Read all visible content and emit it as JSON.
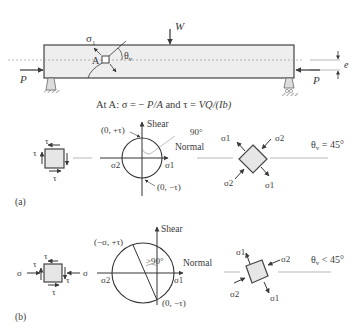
{
  "beam": {
    "load_label": "W",
    "left_force_label": "P",
    "right_force_label": "P",
    "eccentricity_label": "e",
    "point_label": "A",
    "sigma1_label": "σ1",
    "sigma1_main": "σ",
    "sigma1_sub": "1",
    "theta_label": "θ",
    "theta_sub": "v",
    "caption_prefix": "At A: σ = − ",
    "caption_sigma_expr": "P/A",
    "caption_and": " and ",
    "caption_tau_prefix": "τ = ",
    "caption_tau_expr": "VQ/(Ib)"
  },
  "panel_a": {
    "tag": "(a)",
    "element_tau": "τ",
    "mohr": {
      "shear_axis": "Shear",
      "normal_axis": "Normal",
      "top_point": "(0, +τ)",
      "bottom_point": "(0, −τ)",
      "angle": "90°",
      "sigma2": "σ2",
      "sigma1": "σ1"
    },
    "rotated_element": {
      "s1": "σ1",
      "s2": "σ2"
    },
    "theta_relation": "θv = 45°",
    "theta_main": "θ",
    "theta_sub": "v",
    "theta_rest": " = 45°"
  },
  "panel_b": {
    "tag": "(b)",
    "element_tau": "τ",
    "element_sigma": "σ",
    "mohr": {
      "shear_axis": "Shear",
      "normal_axis": "Normal",
      "top_point": "(−σ, +τ)",
      "bottom_point": "(0, −τ)",
      "angle": ">90°",
      "sigma2": "σ2",
      "sigma1": "σ1"
    },
    "rotated_element": {
      "s1": "σ1",
      "s2": "σ2"
    },
    "theta_relation": "θv < 45°",
    "theta_main": "θ",
    "theta_sub": "v",
    "theta_rest": " < 45°"
  },
  "colors": {
    "ink": "#3a3a3a",
    "fill": "#eaeaea",
    "dash": "#9a9a9a"
  }
}
